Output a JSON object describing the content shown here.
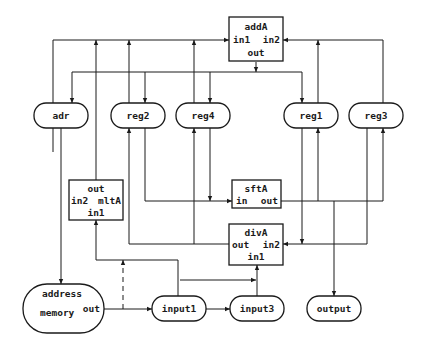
{
  "diagram": {
    "type": "datapath",
    "registers": [
      {
        "id": "adr",
        "label": "adr"
      },
      {
        "id": "reg2",
        "label": "reg2"
      },
      {
        "id": "reg4",
        "label": "reg4"
      },
      {
        "id": "reg1",
        "label": "reg1"
      },
      {
        "id": "reg3",
        "label": "reg3"
      },
      {
        "id": "input1",
        "label": "input1"
      },
      {
        "id": "input3",
        "label": "input3"
      },
      {
        "id": "output",
        "label": "output"
      }
    ],
    "units": {
      "addA": {
        "name": "addA",
        "in1": "in1",
        "in2": "in2",
        "out": "out"
      },
      "mltA": {
        "name": "mltA",
        "in1": "in1",
        "in2": "in2",
        "out": "out"
      },
      "sftA": {
        "name": "sftA",
        "in": "in",
        "out": "out"
      },
      "divA": {
        "name": "divA",
        "in1": "in1",
        "in2": "in2",
        "out": "out"
      }
    },
    "memory": {
      "address": "address",
      "name": "memory",
      "out": "out"
    }
  }
}
